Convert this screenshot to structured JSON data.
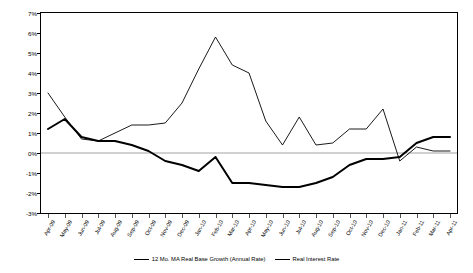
{
  "chart_data": {
    "type": "line",
    "title": "",
    "xlabel": "",
    "ylabel": "",
    "ylim": [
      -3,
      7
    ],
    "ytick_step": 1,
    "grid": false,
    "zero_line": true,
    "legend_position": "bottom",
    "categories": [
      "Apr-09",
      "May-09",
      "Jun-09",
      "Jul-09",
      "Aug-09",
      "Sep-09",
      "Oct-09",
      "Nov-09",
      "Dec-09",
      "Jan-10",
      "Feb-10",
      "Mar-10",
      "Apr-10",
      "May-10",
      "Jun-10",
      "Jul-10",
      "Aug-10",
      "Sep-10",
      "Oct-10",
      "Nov-10",
      "Dec-10",
      "Jan-11",
      "Feb-11",
      "Mar-11",
      "Apr-11"
    ],
    "ytick_labels": [
      "7%",
      "6%",
      "5%",
      "4%",
      "3%",
      "2%",
      "1%",
      "0%",
      "-1%",
      "-2%",
      "-3%"
    ],
    "series": [
      {
        "name": "12 Mo. MA Real Base Growth (Annual Rate)",
        "style": "thick",
        "values": [
          1.2,
          1.7,
          0.8,
          0.6,
          0.6,
          0.4,
          0.1,
          -0.4,
          -0.6,
          -0.9,
          -0.2,
          -1.5,
          -1.5,
          -1.6,
          -1.7,
          -1.7,
          -1.5,
          -1.2,
          -0.6,
          -0.3,
          -0.3,
          -0.2,
          0.5,
          0.8,
          0.8
        ]
      },
      {
        "name": "Real Interest Rate",
        "style": "thin",
        "values": [
          3.0,
          1.8,
          0.7,
          0.6,
          1.0,
          1.4,
          1.4,
          1.5,
          2.5,
          4.2,
          5.8,
          4.4,
          4.0,
          1.6,
          0.4,
          1.8,
          0.4,
          0.5,
          1.2,
          1.2,
          2.2,
          -0.4,
          0.3,
          0.1,
          0.1
        ]
      }
    ]
  },
  "legend": {
    "entries": [
      {
        "label": "12 Mo. MA Real Base Growth (Annual Rate)"
      },
      {
        "label": "Real Interest Rate"
      }
    ]
  }
}
